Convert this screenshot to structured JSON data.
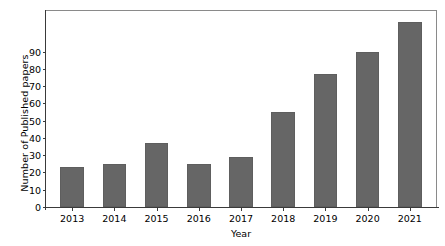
{
  "chart_data": {
    "type": "bar",
    "title": "",
    "subtitle": "",
    "xlabel": "Year",
    "ylabel": "Number of Published papers",
    "categories": [
      "2013",
      "2014",
      "2015",
      "2016",
      "2017",
      "2018",
      "2019",
      "2020",
      "2021"
    ],
    "values": [
      23,
      25,
      37,
      25,
      29,
      55,
      77,
      90,
      107
    ],
    "series": [
      {
        "name": "Number of Published papers",
        "values": [
          23,
          25,
          37,
          25,
          29,
          55,
          77,
          90,
          107
        ]
      }
    ],
    "xtick_labels": [
      "2013",
      "2014",
      "2015",
      "2016",
      "2017",
      "2018",
      "2019",
      "2020",
      "2021"
    ],
    "ytick_labels": [
      "0",
      "10",
      "20",
      "30",
      "40",
      "50",
      "60",
      "70",
      "80",
      "90"
    ],
    "ytick_values": [
      0,
      10,
      20,
      30,
      40,
      50,
      60,
      70,
      80,
      90
    ],
    "ylim": [
      0,
      113.5
    ],
    "xlim": [
      -0.62,
      8.62
    ],
    "grid": false,
    "legend": false,
    "legend_position": "none",
    "bar_color": "#666666",
    "bar_edge_color": "#5e5e5e",
    "axis_color": "#3a3a3a",
    "background_color": "#ffffff",
    "bar_width_fraction": 0.56,
    "annotations": []
  }
}
